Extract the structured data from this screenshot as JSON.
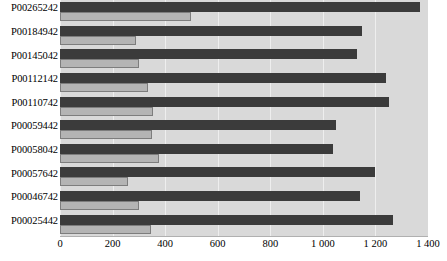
{
  "chart_data": {
    "type": "bar",
    "orientation": "horizontal",
    "title": "",
    "xlabel": "",
    "ylabel": "",
    "xlim": [
      0,
      1400
    ],
    "xticks": [
      0,
      200,
      400,
      600,
      800,
      1000,
      1200,
      1400
    ],
    "xtick_labels": [
      "0",
      "200",
      "400",
      "600",
      "800",
      "1 000",
      "1 200",
      "1 400"
    ],
    "grid": true,
    "legend": "none",
    "categories": [
      "P00265242",
      "P00184942",
      "P00145042",
      "P00112142",
      "P00110742",
      "P00059442",
      "P00058042",
      "P00057642",
      "P00046742",
      "P00025442"
    ],
    "series": [
      {
        "name": "series-1",
        "color": "#3b3b3b",
        "values": [
          1370,
          1150,
          1130,
          1240,
          1250,
          1050,
          1040,
          1200,
          1140,
          1265
        ]
      },
      {
        "name": "series-2",
        "color": "#b4b4b4",
        "values": [
          500,
          290,
          300,
          335,
          355,
          350,
          375,
          260,
          300,
          345
        ]
      }
    ]
  },
  "colors": {
    "plot_background": "#d9d9d9",
    "page_background": "#ffffff",
    "gridline": "#eeeeee",
    "series_dark": "#3b3b3b",
    "series_light": "#b4b4b4",
    "series_light_border": "#7d7d7d",
    "text": "#000000"
  }
}
